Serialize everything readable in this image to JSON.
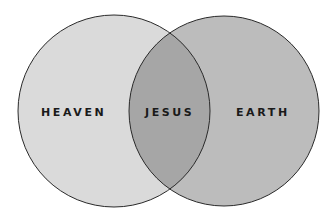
{
  "diagram": {
    "type": "venn",
    "sets": [
      {
        "label": "HEAVEN",
        "color": "#dadada"
      },
      {
        "label": "EARTH",
        "color": "#bcbcbc"
      }
    ],
    "intersection": {
      "label": "JESUS",
      "color": "#a6a6a6"
    },
    "outline_color": "#2a2a2a"
  }
}
